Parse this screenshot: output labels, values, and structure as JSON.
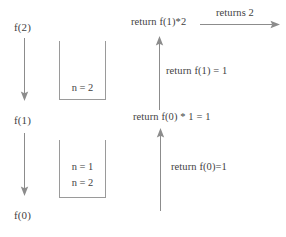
{
  "diagram": {
    "colors": {
      "background": "#ffffff",
      "text": "#3f3f3f",
      "line": "#8c8c8c",
      "box_border": "#9a9a9a"
    },
    "call_chain": {
      "nodes": [
        {
          "label": "f(2)"
        },
        {
          "label": "f(1)"
        },
        {
          "label": "f(0)"
        }
      ],
      "arrows": [
        {
          "name": "call-arrow-f2-to-f1",
          "direction": "down"
        },
        {
          "name": "call-arrow-f1-to-f0",
          "direction": "down"
        }
      ]
    },
    "stack_frames": [
      {
        "name": "stack-frame-upper",
        "entries": [
          "n = 2"
        ]
      },
      {
        "name": "stack-frame-lower",
        "entries": [
          "n = 1",
          "n = 2"
        ]
      }
    ],
    "returns": {
      "top_label": "return f(1)*2",
      "middle_label": "return f(0) * 1 = 1",
      "annotation_upper": "return f(1) = 1",
      "annotation_lower": "return f(0)=1",
      "final_label": "returns 2",
      "arrows": [
        {
          "name": "return-arrow-final",
          "direction": "right"
        },
        {
          "name": "return-arrow-upper",
          "direction": "up"
        },
        {
          "name": "return-arrow-lower",
          "direction": "up"
        }
      ]
    }
  }
}
